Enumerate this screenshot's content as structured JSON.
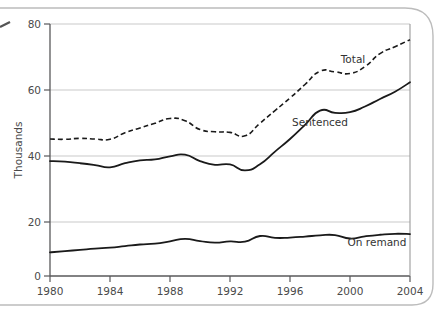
{
  "figure": {
    "background_color": "#ffffff",
    "frame_color": "#b9b9b9",
    "axis_color": "#58585a",
    "grid_color": "#c9c9c9",
    "series_color": "#1a1a1a"
  },
  "chart_data": {
    "type": "line",
    "title": "",
    "subtitle": "",
    "xlabel": "",
    "ylabel": "Thousands",
    "xlim": [
      1980,
      2004
    ],
    "ylim": [
      0,
      80
    ],
    "grid": "horizontal",
    "legend_position": "inline-annotations",
    "ytick_labels": [
      "0",
      "20",
      "40",
      "60",
      "80"
    ],
    "ytick_values": [
      0,
      20,
      40,
      60,
      80
    ],
    "xtick_labels": [
      "1980",
      "1984",
      "1988",
      "1992",
      "1996",
      "2000",
      "2004"
    ],
    "xtick_values": [
      1980,
      1984,
      1988,
      1992,
      1996,
      2000,
      2004
    ],
    "x": [
      1980,
      1981,
      1982,
      1983,
      1984,
      1985,
      1986,
      1987,
      1988,
      1989,
      1990,
      1991,
      1992,
      1993,
      1994,
      1995,
      1996,
      1997,
      1998,
      1999,
      2000,
      2001,
      2002,
      2003,
      2004
    ],
    "series": [
      {
        "name": "Total",
        "style": "dashed",
        "label": "Total",
        "label_x": 2000.2,
        "label_y": 67.5,
        "values": [
          43.5,
          43.4,
          43.7,
          43.5,
          43.4,
          45.5,
          47.0,
          48.5,
          50.0,
          49.3,
          46.5,
          45.8,
          45.6,
          44.5,
          48.5,
          52.5,
          56.5,
          60.8,
          65.0,
          64.8,
          64.3,
          66.5,
          70.6,
          72.8,
          75.0
        ]
      },
      {
        "name": "Sentenced",
        "style": "solid",
        "label": "Sentenced",
        "label_x": 1998.0,
        "label_y": 47.5,
        "values": [
          36.5,
          36.3,
          35.8,
          35.2,
          34.5,
          35.8,
          36.7,
          37.0,
          38.0,
          38.5,
          36.5,
          35.3,
          35.4,
          33.5,
          35.5,
          39.5,
          43.5,
          48.0,
          52.5,
          51.8,
          52.0,
          53.8,
          56.2,
          58.5,
          61.5
        ]
      },
      {
        "name": "On remand",
        "style": "solid",
        "label": "On remand",
        "label_x": 2001.8,
        "label_y": 9.5,
        "values": [
          7.5,
          7.9,
          8.3,
          8.7,
          9.0,
          9.5,
          10.0,
          10.3,
          11.0,
          11.8,
          11.1,
          10.6,
          11.0,
          10.9,
          12.7,
          12.1,
          12.2,
          12.5,
          12.9,
          13.0,
          11.9,
          12.6,
          13.1,
          13.4,
          13.3
        ]
      }
    ]
  }
}
